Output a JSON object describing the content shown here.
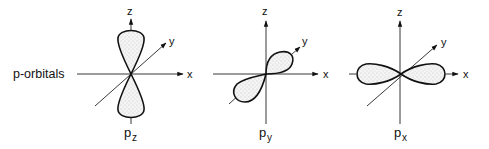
{
  "diagram": {
    "title": "p-orbitals",
    "orbitals": [
      {
        "name": "pz",
        "label_main": "p",
        "label_sub": "z",
        "axes": {
          "z": "z",
          "y": "y",
          "x": "x"
        }
      },
      {
        "name": "py",
        "label_main": "p",
        "label_sub": "y",
        "axes": {
          "z": "z",
          "y": "y",
          "x": "x"
        }
      },
      {
        "name": "px",
        "label_main": "p",
        "label_sub": "x",
        "axes": {
          "z": "z",
          "y": "y",
          "x": "x"
        }
      }
    ]
  }
}
